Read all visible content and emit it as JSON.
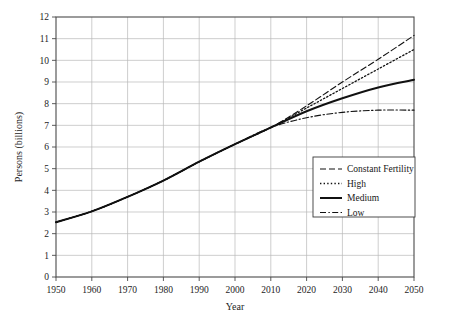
{
  "chart_data": {
    "type": "line",
    "title": "",
    "subtitle": "",
    "xlabel": "Year",
    "ylabel": "Persons (billions)",
    "xlim": [
      1950,
      2050
    ],
    "ylim": [
      0,
      12
    ],
    "xticks": [
      1950,
      1960,
      1970,
      1980,
      1990,
      2000,
      2010,
      2020,
      2030,
      2040,
      2050
    ],
    "yticks": [
      0,
      1,
      2,
      3,
      4,
      5,
      6,
      7,
      8,
      9,
      10,
      11,
      12
    ],
    "grid": true,
    "legend_position": "bottom-right",
    "x": [
      1950,
      1960,
      1970,
      1980,
      1990,
      2000,
      2010,
      2020,
      2030,
      2040,
      2050
    ],
    "series": [
      {
        "name": "Constant Fertility",
        "style": "dashed",
        "values": [
          2.53,
          3.03,
          3.7,
          4.45,
          5.32,
          6.13,
          6.9,
          7.9,
          9.0,
          10.05,
          11.15
        ]
      },
      {
        "name": "High",
        "style": "dotted",
        "values": [
          2.53,
          3.03,
          3.7,
          4.45,
          5.32,
          6.13,
          6.9,
          7.8,
          8.7,
          9.6,
          10.5
        ]
      },
      {
        "name": "Medium",
        "style": "solid",
        "values": [
          2.53,
          3.03,
          3.7,
          4.45,
          5.32,
          6.13,
          6.9,
          7.65,
          8.25,
          8.75,
          9.1
        ]
      },
      {
        "name": "Low",
        "style": "dashdot",
        "values": [
          2.53,
          3.03,
          3.7,
          4.45,
          5.32,
          6.13,
          6.9,
          7.35,
          7.6,
          7.7,
          7.7
        ]
      }
    ]
  },
  "axes": {
    "y_title": "Persons (billions)",
    "x_title": "Year",
    "x_tick_labels": [
      "1950",
      "1960",
      "1970",
      "1980",
      "1990",
      "2000",
      "2010",
      "2020",
      "2030",
      "2040",
      "2050"
    ],
    "y_tick_labels": [
      "0",
      "1",
      "2",
      "3",
      "4",
      "5",
      "6",
      "7",
      "8",
      "9",
      "10",
      "11",
      "12"
    ]
  },
  "legend": {
    "items": [
      {
        "label": "Constant Fertility",
        "style": "dashed"
      },
      {
        "label": "High",
        "style": "dotted"
      },
      {
        "label": "Medium",
        "style": "solid"
      },
      {
        "label": "Low",
        "style": "dashdot"
      }
    ]
  },
  "colors": {
    "line": "#111111",
    "grid": "#b9b9b9",
    "frame": "#4a4a4a",
    "background": "#ffffff",
    "text": "#1a1a1a"
  }
}
